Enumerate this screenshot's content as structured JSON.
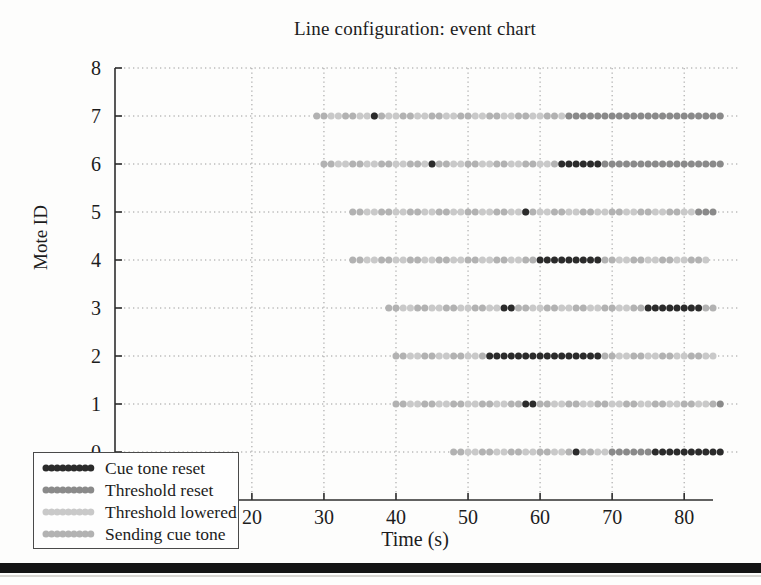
{
  "figure": {
    "bottom_rule_color": "#141414",
    "background": "#fdfdfc"
  },
  "chart_data": {
    "type": "scatter",
    "subtype": "event-chart",
    "title": "Line configuration: event chart",
    "xlabel": "Time (s)",
    "ylabel": "Mote ID",
    "xlim": [
      1,
      84
    ],
    "ylim": [
      -1,
      8
    ],
    "xticks": [
      20,
      30,
      40,
      50,
      60,
      70,
      80
    ],
    "yticks": [
      0,
      1,
      2,
      3,
      4,
      5,
      6,
      7,
      8
    ],
    "grid": "dotted",
    "grid_color": "#9a9a9a",
    "axis_color": "#2e2e2e",
    "legend_position": "bottom-left-overlapping-axes",
    "dot_interval_s": 1,
    "dot_radius_px": 3.5,
    "legend": [
      {
        "key": "cue_tone_reset",
        "label": "Cue tone reset",
        "color": "#2b2b2b"
      },
      {
        "key": "threshold_reset",
        "label": "Threshold reset",
        "color": "#8a8a8a"
      },
      {
        "key": "threshold_lowered",
        "label": "Threshold lowered",
        "color": "#c9c9c9"
      },
      {
        "key": "sending_cue_tone",
        "label": "Sending cue tone",
        "color": "#b2b2b2"
      }
    ],
    "motes": [
      {
        "id": 7,
        "segments": [
          {
            "event": "sending_cue_tone",
            "interleave": "threshold_lowered",
            "from": 29,
            "to": 63
          },
          {
            "event": "threshold_reset",
            "from": 64,
            "to": 85
          },
          {
            "event": "cue_tone_reset",
            "from": 37,
            "to": 37
          }
        ]
      },
      {
        "id": 6,
        "segments": [
          {
            "event": "sending_cue_tone",
            "interleave": "threshold_lowered",
            "from": 30,
            "to": 62
          },
          {
            "event": "cue_tone_reset",
            "from": 63,
            "to": 68
          },
          {
            "event": "threshold_reset",
            "from": 69,
            "to": 85
          },
          {
            "event": "cue_tone_reset",
            "from": 45,
            "to": 45
          }
        ]
      },
      {
        "id": 5,
        "segments": [
          {
            "event": "sending_cue_tone",
            "interleave": "threshold_lowered",
            "from": 34,
            "to": 81
          },
          {
            "event": "threshold_reset",
            "from": 82,
            "to": 84
          },
          {
            "event": "cue_tone_reset",
            "from": 58,
            "to": 58
          }
        ]
      },
      {
        "id": 4,
        "segments": [
          {
            "event": "sending_cue_tone",
            "interleave": "threshold_lowered",
            "from": 34,
            "to": 59
          },
          {
            "event": "cue_tone_reset",
            "from": 60,
            "to": 68
          },
          {
            "event": "sending_cue_tone",
            "interleave": "threshold_lowered",
            "from": 69,
            "to": 83
          }
        ]
      },
      {
        "id": 3,
        "segments": [
          {
            "event": "sending_cue_tone",
            "interleave": "threshold_lowered",
            "from": 39,
            "to": 54
          },
          {
            "event": "cue_tone_reset",
            "from": 55,
            "to": 56
          },
          {
            "event": "sending_cue_tone",
            "interleave": "threshold_lowered",
            "from": 57,
            "to": 74
          },
          {
            "event": "cue_tone_reset",
            "from": 75,
            "to": 82
          },
          {
            "event": "sending_cue_tone",
            "interleave": "threshold_lowered",
            "from": 83,
            "to": 84
          }
        ]
      },
      {
        "id": 2,
        "segments": [
          {
            "event": "sending_cue_tone",
            "interleave": "threshold_lowered",
            "from": 40,
            "to": 52
          },
          {
            "event": "cue_tone_reset",
            "from": 53,
            "to": 68
          },
          {
            "event": "sending_cue_tone",
            "interleave": "threshold_lowered",
            "from": 69,
            "to": 84
          }
        ]
      },
      {
        "id": 1,
        "segments": [
          {
            "event": "sending_cue_tone",
            "interleave": "threshold_lowered",
            "from": 40,
            "to": 57
          },
          {
            "event": "cue_tone_reset",
            "from": 58,
            "to": 59
          },
          {
            "event": "sending_cue_tone",
            "interleave": "threshold_lowered",
            "from": 60,
            "to": 84
          },
          {
            "event": "threshold_reset",
            "from": 85,
            "to": 85
          }
        ]
      },
      {
        "id": 0,
        "segments": [
          {
            "event": "sending_cue_tone",
            "interleave": "threshold_lowered",
            "from": 48,
            "to": 64
          },
          {
            "event": "cue_tone_reset",
            "from": 65,
            "to": 65
          },
          {
            "event": "sending_cue_tone",
            "interleave": "threshold_lowered",
            "from": 66,
            "to": 69
          },
          {
            "event": "threshold_reset",
            "from": 70,
            "to": 75
          },
          {
            "event": "cue_tone_reset",
            "from": 76,
            "to": 85
          }
        ]
      }
    ]
  }
}
